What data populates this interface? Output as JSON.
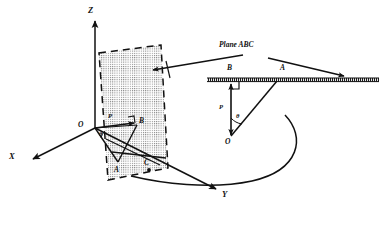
{
  "figure": {
    "type": "geometry-diagram",
    "background_color": "#ffffff",
    "ink_color": "#111111",
    "plane_fill": "stippled-gray",
    "plane_border": "dashed"
  },
  "left_view": {
    "name": "3d-coordinate-view",
    "axes": [
      {
        "id": "z",
        "label": "Z",
        "direction": "up"
      },
      {
        "id": "x",
        "label": "X",
        "direction": "down-left"
      },
      {
        "id": "y",
        "label": "Y",
        "direction": "down-right"
      }
    ],
    "origin_label": "O",
    "points": [
      {
        "id": "a",
        "label": "A"
      },
      {
        "id": "b",
        "label": "B"
      },
      {
        "id": "c",
        "label": "C"
      }
    ],
    "vector_label": "P",
    "angle_label": "θ"
  },
  "right_view": {
    "name": "edge-on-view",
    "caption": "Plane ABC",
    "points": [
      {
        "id": "b",
        "label": "B"
      },
      {
        "id": "a",
        "label": "A"
      },
      {
        "id": "o",
        "label": "O"
      }
    ],
    "vector_label": "P",
    "angle_label": "θ",
    "right_angle_marker": true,
    "leader_arrows": 2
  },
  "connector": {
    "name": "view-link-curve",
    "style": "curved-line"
  }
}
